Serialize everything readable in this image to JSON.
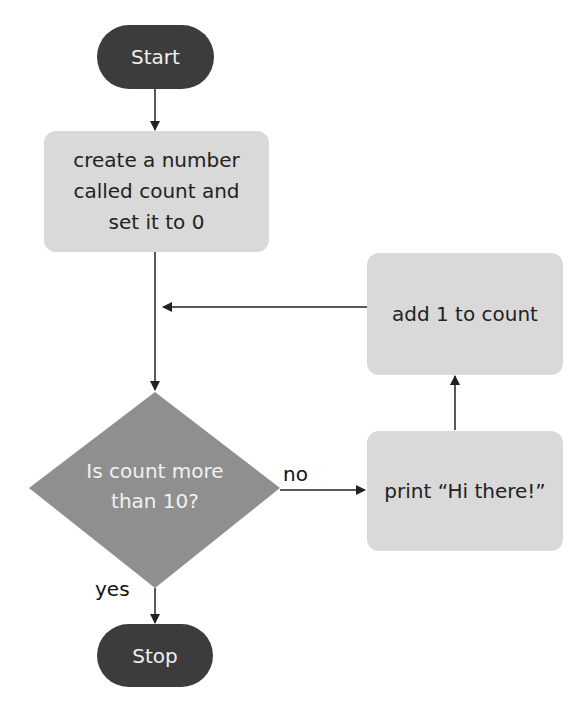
{
  "diagram": {
    "type": "flowchart",
    "colors": {
      "terminal": "#3c3c3c",
      "process": "#d9d9d9",
      "decision": "#8f8f8f",
      "arrow": "#222222"
    },
    "nodes": {
      "start": {
        "label": "Start"
      },
      "init": {
        "line1": "create a number",
        "line2": "called count and",
        "line3": "set it to 0"
      },
      "increment": {
        "label": "add 1 to count"
      },
      "decision": {
        "line1": "Is count more",
        "line2": "than 10?"
      },
      "print": {
        "label": "print “Hi there!”"
      },
      "stop": {
        "label": "Stop"
      }
    },
    "edges": {
      "no_label": "no",
      "yes_label": "yes"
    }
  }
}
